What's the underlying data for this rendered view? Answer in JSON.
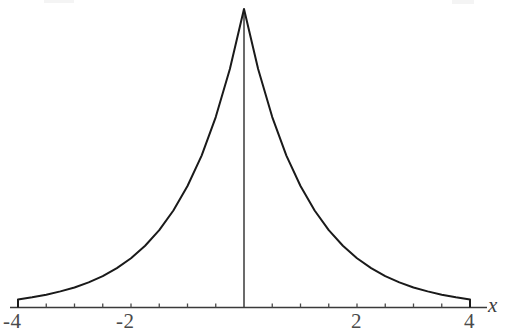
{
  "chart_data": {
    "type": "line",
    "title": "",
    "subtitle": "",
    "xlabel": "x",
    "ylabel": "",
    "xlim": [
      -4.35,
      4.35
    ],
    "ylim": [
      0,
      1.05
    ],
    "grid": false,
    "legend": null,
    "annotations": [],
    "axis_labels": {
      "x": "x"
    },
    "x_ticks_major": [
      -4,
      -2,
      2,
      4
    ],
    "x_tick_labels": [
      "-4",
      "-2",
      "2",
      "4"
    ],
    "x_ticks_minor_step": 0.5,
    "x_ticks_minor": [
      -4,
      -3.5,
      -3,
      -2.5,
      -2,
      -1.5,
      -1,
      -0.5,
      0,
      0.5,
      1,
      1.5,
      2,
      2.5,
      3,
      3.5,
      4
    ],
    "y_ticks": [],
    "y_tick_labels": [],
    "series": [
      {
        "name": "exponential-decay",
        "description": "symmetric double-exponential peak, cusp at x = 0",
        "color": "#1a1a1a",
        "line_width": 2,
        "x": [
          -4,
          -3.75,
          -3.5,
          -3.25,
          -3,
          -2.75,
          -2.5,
          -2.25,
          -2,
          -1.75,
          -1.5,
          -1.25,
          -1,
          -0.75,
          -0.5,
          -0.25,
          0,
          0.25,
          0.5,
          0.75,
          1,
          1.25,
          1.5,
          1.75,
          2,
          2.25,
          2.5,
          2.75,
          3,
          3.25,
          3.5,
          3.75,
          4
        ],
        "y": [
          0.027,
          0.034,
          0.043,
          0.054,
          0.067,
          0.084,
          0.105,
          0.132,
          0.165,
          0.207,
          0.259,
          0.325,
          0.407,
          0.509,
          0.638,
          0.799,
          1.0,
          0.799,
          0.638,
          0.509,
          0.407,
          0.325,
          0.259,
          0.207,
          0.165,
          0.132,
          0.105,
          0.084,
          0.067,
          0.054,
          0.043,
          0.034,
          0.027
        ]
      }
    ],
    "vertical_axis_line": {
      "x": 0,
      "from_y": 0,
      "to_y": 1.0
    }
  },
  "labels": {
    "x_neg4": "-4",
    "x_neg2": "-2",
    "x_pos2": "2",
    "x_pos4": "4",
    "axis_x": "x"
  },
  "colors": {
    "curve": "#1a1a1a",
    "axis": "#3a3a3a",
    "text": "#4a4a4a",
    "background": "#ffffff"
  }
}
